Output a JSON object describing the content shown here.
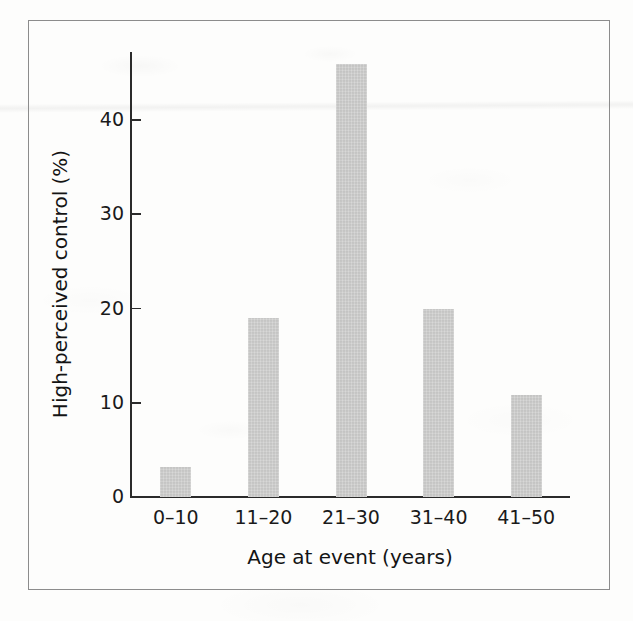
{
  "figure": {
    "frame_color": "#8c8c8c",
    "background_color": "#fdfdfc",
    "bar_color": "#c9c9c8",
    "axis_color": "#2b2b2b",
    "text_color": "#141414"
  },
  "chart_data": {
    "type": "bar",
    "title": "",
    "subtitle": "",
    "xlabel": "Age at event (years)",
    "ylabel": "High-perceived control (%)",
    "categories": [
      "0–10",
      "11–20",
      "21–30",
      "31–40",
      "41–50"
    ],
    "values": [
      3.2,
      19.0,
      45.9,
      20.0,
      10.8
    ],
    "ylim": [
      0,
      47
    ],
    "yticks": [
      0,
      10,
      20,
      30,
      40
    ],
    "ytick_labels": [
      "0",
      "10",
      "20",
      "30",
      "40"
    ],
    "grid": false,
    "legend": null,
    "annotations": [],
    "series": [
      {
        "name": "High-perceived control",
        "values": [
          3.2,
          19.0,
          45.9,
          20.0,
          10.8
        ]
      }
    ]
  }
}
